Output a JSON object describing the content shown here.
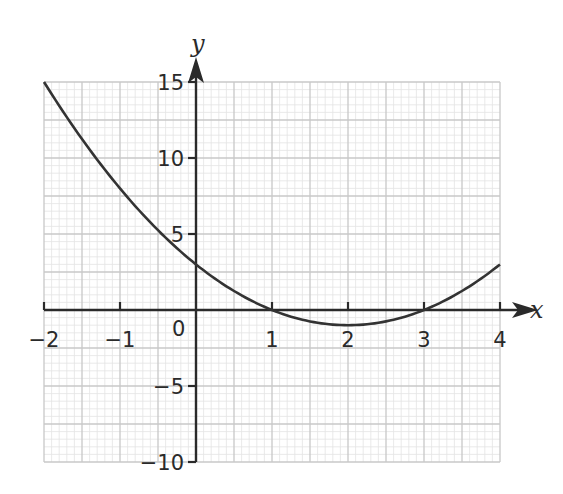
{
  "chart_data": {
    "type": "line",
    "title": "",
    "xlabel": "x",
    "ylabel": "y",
    "xlim": [
      -2,
      4
    ],
    "ylim": [
      -10,
      15
    ],
    "x_ticks": [
      -2,
      -1,
      0,
      1,
      2,
      3,
      4
    ],
    "x_tick_labels": [
      "−2",
      "−1",
      "0",
      "1",
      "2",
      "3",
      "4"
    ],
    "y_ticks": [
      -10,
      -5,
      5,
      10,
      15
    ],
    "y_tick_labels": [
      "−10",
      "−5",
      "5",
      "10",
      "15"
    ],
    "grid": true,
    "grid_minor": true,
    "series": [
      {
        "name": "y = x² − 4x + 3",
        "x": [
          -2,
          -1.5,
          -1,
          -0.5,
          0,
          0.5,
          1,
          1.5,
          2,
          2.5,
          3,
          3.5,
          4
        ],
        "values": [
          15,
          11.25,
          8,
          5.25,
          3,
          1.25,
          0,
          -0.75,
          -1,
          -0.75,
          0,
          1.25,
          3
        ]
      }
    ],
    "legend": null
  },
  "colors": {
    "curve": "#333333",
    "axis": "#2a2a2a",
    "grid_major": "#c8c8c8",
    "grid_minor": "#e4e4e4"
  }
}
